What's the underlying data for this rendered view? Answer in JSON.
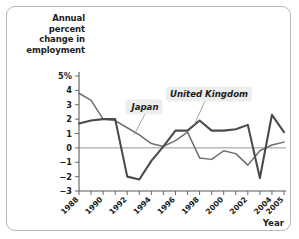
{
  "figure": {
    "y_axis_title": "Annual percent change in employment",
    "x_axis_title": "Year"
  },
  "annotations": {
    "japan": "Japan",
    "uk": "United Kingdom"
  },
  "colors": {
    "japan_line": "#6d6e71",
    "uk_line": "#4b4b4d",
    "axis": "#58595b",
    "zero_line": "#8b8b8b",
    "annotation_box": "#eceded",
    "frame": "#b9b9b9"
  },
  "chart_data": {
    "type": "line",
    "title": "",
    "subtitle": "",
    "xlabel": "Year",
    "ylabel": "Annual percent change in employment",
    "xlim": [
      1988,
      2005
    ],
    "ylim": [
      -3,
      5
    ],
    "yticks": [
      -3,
      -2,
      -1,
      0,
      1,
      2,
      3,
      4,
      5
    ],
    "ytick_labels": [
      "−3",
      "−2",
      "−1",
      "0",
      "1",
      "2",
      "3",
      "4",
      "5%"
    ],
    "xticks": [
      1988,
      1989,
      1990,
      1991,
      1992,
      1993,
      1994,
      1995,
      1996,
      1997,
      1998,
      1999,
      2000,
      2001,
      2002,
      2003,
      2004,
      2005
    ],
    "xtick_labels": [
      "1988",
      "1990",
      "1992",
      "1994",
      "1996",
      "1998",
      "2000",
      "2002",
      "2004",
      "2005"
    ],
    "xtick_label_years": [
      1988,
      1990,
      1992,
      1994,
      1996,
      1998,
      2000,
      2002,
      2004,
      2005
    ],
    "grid": false,
    "legend_position": "inline-annotations",
    "x": [
      1988,
      1989,
      1990,
      1991,
      1992,
      1993,
      1994,
      1995,
      1996,
      1997,
      1998,
      1999,
      2000,
      2001,
      2002,
      2003,
      2004,
      2005
    ],
    "series": [
      {
        "name": "Japan",
        "values": [
          3.8,
          3.3,
          2.0,
          1.9,
          1.4,
          0.9,
          0.3,
          0.1,
          0.5,
          1.1,
          -0.7,
          -0.8,
          -0.2,
          -0.4,
          -1.2,
          -0.2,
          0.2,
          0.4
        ]
      },
      {
        "name": "United Kingdom",
        "values": [
          1.7,
          1.9,
          2.0,
          2.0,
          -2.0,
          -2.2,
          -0.9,
          0.1,
          1.2,
          1.2,
          1.9,
          1.2,
          1.2,
          1.3,
          1.6,
          -2.1,
          2.3,
          1.1
        ]
      }
    ],
    "annotations": [
      {
        "label": "Japan",
        "series": "Japan"
      },
      {
        "label": "United Kingdom",
        "series": "United Kingdom"
      }
    ]
  }
}
